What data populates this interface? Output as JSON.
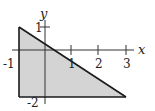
{
  "diagram": {
    "type": "region-plot",
    "axes": {
      "x_label": "x",
      "y_label": "y",
      "x_ticks": [
        "-1",
        "1",
        "2",
        "3"
      ],
      "y_ticks": [
        "1",
        "-2"
      ]
    },
    "region": {
      "shape": "triangle",
      "vertices": [
        [
          -1,
          1
        ],
        [
          -1,
          -2
        ],
        [
          3,
          -2
        ]
      ],
      "fill_color": "#d4d4d4",
      "edge_color": "#1a1a1a"
    },
    "colors": {
      "axis": "#333333",
      "background": "#ffffff"
    }
  }
}
